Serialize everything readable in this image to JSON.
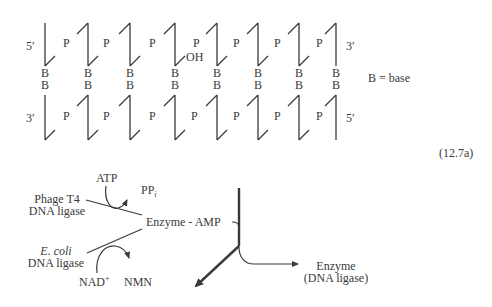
{
  "figure": {
    "equation_number": "(12.7a)"
  },
  "dna_duplex": {
    "top_strand": {
      "left_end": "5′",
      "right_end": "3′"
    },
    "bottom_strand": {
      "left_end": "3′",
      "right_end": "5′"
    },
    "phosphate_label": "P",
    "base_label": "B",
    "nick_label": "OH",
    "legend": "B = base",
    "nucleotide_x": [
      45,
      88,
      130,
      175,
      217,
      258,
      299,
      336
    ],
    "top_phosphate_x": [
      67,
      107,
      153,
      197,
      237,
      278,
      320
    ],
    "bottom_phosphate_x": [
      67,
      107,
      153,
      195,
      237,
      278,
      320
    ],
    "nick_after_index": 3
  },
  "reaction": {
    "phage_enzyme": {
      "line1": "Phage T4",
      "line2": "DNA ligase"
    },
    "atp": "ATP",
    "ppi": "PP",
    "ppi_sub": "i",
    "intermediate": "Enzyme - AMP",
    "ecoli_enzyme": {
      "line1": "E. coli",
      "line2": "DNA ligase"
    },
    "nad": "NAD",
    "nad_sup": "+",
    "nmn": "NMN",
    "product": {
      "line1": "Enzyme",
      "line2": "(DNA ligase)"
    }
  },
  "colors": {
    "stroke": "#3a3a3a",
    "text": "#3a3a3a",
    "background": "#ffffff"
  }
}
